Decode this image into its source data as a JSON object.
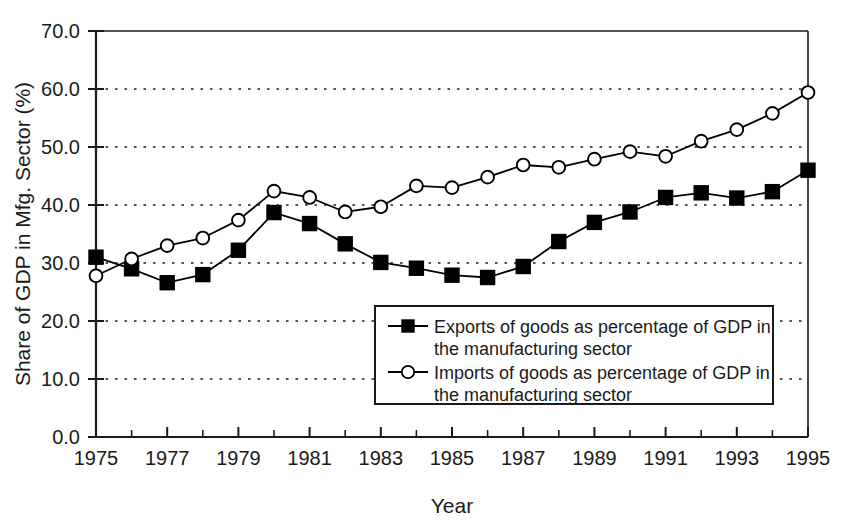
{
  "chart_data": {
    "type": "line",
    "title": "",
    "xlabel": "Year",
    "ylabel": "Share of GDP in Mfg. Sector (%)",
    "xlim": [
      1975,
      1995
    ],
    "ylim": [
      0.0,
      70.0
    ],
    "grid": true,
    "grid_axis": "y",
    "legend_position": "inside-bottom-center",
    "x": [
      1975,
      1976,
      1977,
      1978,
      1979,
      1980,
      1981,
      1982,
      1983,
      1984,
      1985,
      1986,
      1987,
      1988,
      1989,
      1990,
      1991,
      1992,
      1993,
      1994,
      1995
    ],
    "x_tick_labels": [
      "1975",
      "1977",
      "1979",
      "1981",
      "1983",
      "1985",
      "1987",
      "1989",
      "1991",
      "1993",
      "1995"
    ],
    "x_tick_values": [
      1975,
      1977,
      1979,
      1981,
      1983,
      1985,
      1987,
      1989,
      1991,
      1993,
      1995
    ],
    "y_tick_labels": [
      "0.0",
      "10.0",
      "20.0",
      "30.0",
      "40.0",
      "50.0",
      "60.0",
      "70.0"
    ],
    "y_tick_values": [
      0.0,
      10.0,
      20.0,
      30.0,
      40.0,
      50.0,
      60.0,
      70.0
    ],
    "series": [
      {
        "name": "Exports of goods as percentage of GDP in the manufacturing sector",
        "legend_line1": "Exports of goods as percentage of GDP in",
        "legend_line2": "the manufacturing sector",
        "marker": "filled-square",
        "color": "#000000",
        "values": [
          31.0,
          29.0,
          26.6,
          28.0,
          32.2,
          38.7,
          36.8,
          33.3,
          30.1,
          29.1,
          27.9,
          27.5,
          29.4,
          33.7,
          37.0,
          38.8,
          41.3,
          42.1,
          41.2,
          42.3,
          46.0
        ]
      },
      {
        "name": "Imports of goods as percentage of GDP in the manufacturing sector",
        "legend_line1": "Imports of goods as percentage of GDP in",
        "legend_line2": "the manufacturing sector",
        "marker": "open-circle",
        "color": "#000000",
        "values": [
          27.8,
          30.7,
          33.0,
          34.3,
          37.4,
          42.4,
          41.3,
          38.8,
          39.7,
          43.3,
          43.0,
          44.8,
          46.9,
          46.5,
          47.9,
          49.2,
          48.4,
          51.0,
          53.0,
          55.8,
          59.4
        ]
      }
    ]
  },
  "axes": {
    "y_axis_title": "Share of GDP in Mfg. Sector (%)",
    "x_axis_title": "Year"
  },
  "legend": {
    "series": [
      {
        "line1": "Exports of goods as percentage of GDP in",
        "line2": "the manufacturing sector",
        "marker": "filled-square"
      },
      {
        "line1": "Imports of goods as percentage of GDP in",
        "line2": "the manufacturing sector",
        "marker": "open-circle"
      }
    ]
  }
}
